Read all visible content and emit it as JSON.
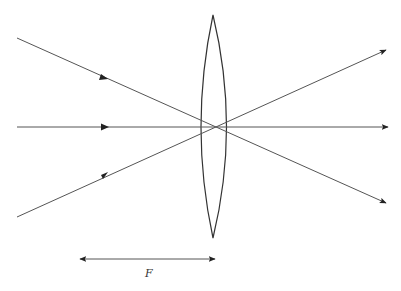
{
  "diagram": {
    "title": "",
    "colors": {
      "line": "#444444",
      "lens": "#333333",
      "background": "#ffffff"
    },
    "lens": {
      "type": "biconvex",
      "center": [
        214,
        127
      ],
      "top": [
        213,
        15
      ],
      "bottom": [
        213,
        238
      ]
    },
    "rays": [
      {
        "name": "upper-ray",
        "from": [
          17,
          38
        ],
        "to": [
          386,
          203
        ]
      },
      {
        "name": "axis-ray",
        "from": [
          17,
          127
        ],
        "to": [
          388,
          127
        ]
      },
      {
        "name": "lower-ray",
        "from": [
          17,
          217
        ],
        "to": [
          386,
          50
        ]
      }
    ],
    "focal_length_marker": {
      "label": "F",
      "from": [
        80,
        259
      ],
      "to": [
        215,
        259
      ]
    }
  }
}
